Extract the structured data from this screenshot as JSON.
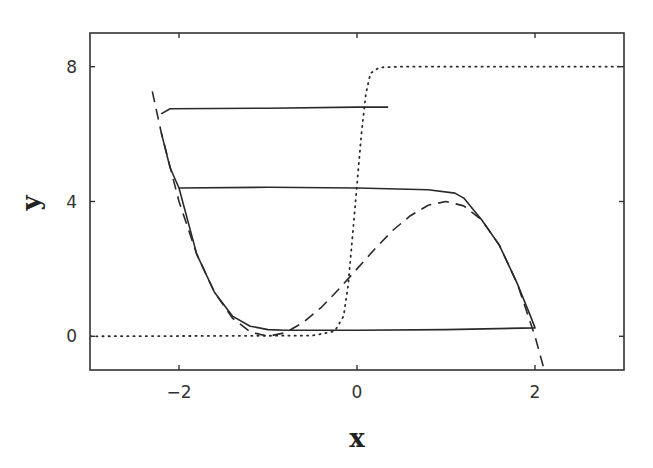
{
  "chart_data": {
    "type": "line",
    "title": "",
    "xlabel": "x",
    "ylabel": "y",
    "xlim": [
      -3,
      3
    ],
    "ylim": [
      -1,
      9
    ],
    "xticks": [
      -2,
      0,
      2
    ],
    "yticks": [
      0,
      4,
      8
    ],
    "xtick_labels": [
      "−2",
      "0",
      "2"
    ],
    "ytick_labels": [
      "0",
      "4",
      "8"
    ],
    "grid": false,
    "legend": null,
    "series": [
      {
        "name": "cubic nullcline y = 2 + 3x - x^3",
        "style": "dashed",
        "x": [
          -2.3,
          -2.2,
          -2.0,
          -1.8,
          -1.6,
          -1.4,
          -1.2,
          -1.0,
          -0.8,
          -0.6,
          -0.4,
          -0.2,
          0.0,
          0.2,
          0.4,
          0.6,
          0.8,
          1.0,
          1.2,
          1.4,
          1.6,
          1.8,
          2.0,
          2.1,
          2.2
        ],
        "y": [
          7.27,
          6.05,
          4.0,
          2.43,
          1.3,
          0.54,
          0.13,
          0.0,
          0.11,
          0.42,
          0.86,
          1.41,
          2.0,
          2.59,
          3.14,
          3.58,
          3.89,
          4.0,
          3.87,
          3.46,
          2.7,
          1.57,
          0.0,
          -0.96,
          -2.05
        ]
      },
      {
        "name": "sigmoid nullcline",
        "style": "dotted",
        "x": [
          -3.0,
          -0.5,
          -0.25,
          -0.15,
          -0.1,
          -0.05,
          0.0,
          0.05,
          0.1,
          0.15,
          0.25,
          0.5,
          3.0
        ],
        "y": [
          0.0,
          0.02,
          0.15,
          0.6,
          1.5,
          3.0,
          4.5,
          6.0,
          7.2,
          7.8,
          7.98,
          8.0,
          8.0
        ]
      },
      {
        "name": "trajectory (limit cycle)",
        "style": "solid",
        "x": [
          -2.2,
          -2.1,
          -2.0,
          -1.0,
          0.0,
          0.8,
          1.1,
          1.2,
          1.4,
          1.6,
          1.8,
          1.95,
          2.0,
          1.0,
          0.0,
          -0.8,
          -1.0,
          -1.2,
          -1.4,
          -1.6,
          -1.8,
          -2.0
        ],
        "y": [
          6.05,
          5.0,
          4.4,
          4.42,
          4.4,
          4.35,
          4.25,
          4.1,
          3.46,
          2.7,
          1.57,
          0.6,
          0.25,
          0.2,
          0.18,
          0.18,
          0.2,
          0.3,
          0.6,
          1.3,
          2.43,
          4.4
        ]
      },
      {
        "name": "trajectory (transient)",
        "style": "solid",
        "x": [
          -2.2,
          -2.1,
          -1.0,
          0.0,
          0.35
        ],
        "y": [
          6.6,
          6.75,
          6.77,
          6.8,
          6.8
        ]
      }
    ]
  },
  "axes": {
    "x_label": "x",
    "y_label": "y",
    "x_tick_labels": [
      "−2",
      "0",
      "2"
    ],
    "y_tick_labels": [
      "0",
      "4",
      "8"
    ]
  }
}
